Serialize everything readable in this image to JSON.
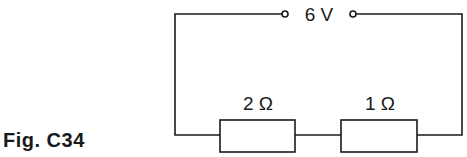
{
  "figure": {
    "label": "Fig. C34"
  },
  "circuit": {
    "source": {
      "label": "6 V",
      "type": "voltage-terminals"
    },
    "resistors": [
      {
        "label": "2 Ω",
        "value_ohm": 2
      },
      {
        "label": "1 Ω",
        "value_ohm": 1
      }
    ],
    "topology": "series",
    "colors": {
      "line": "#1a1a1a",
      "background": "#ffffff"
    }
  }
}
